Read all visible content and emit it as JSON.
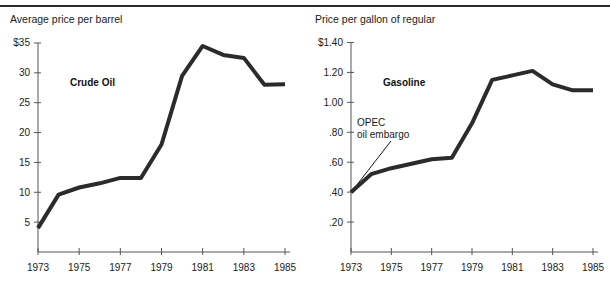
{
  "figure": {
    "divider_present": true,
    "panel_count": 2,
    "line_color": "#2b2b2b",
    "axis_color": "#555555",
    "background": "#ffffff"
  },
  "chart_data": [
    {
      "type": "line",
      "title": "Average price per barrel",
      "series_label": "Crude Oil",
      "xlabel": "",
      "ylabel": "",
      "grid": false,
      "legend": "none",
      "xlim": [
        1973,
        1985
      ],
      "ylim": [
        0,
        36
      ],
      "xticks": [
        1973,
        1975,
        1977,
        1979,
        1981,
        1983,
        1985
      ],
      "xtick_labels": [
        "1973",
        "1975",
        "1977",
        "1979",
        "1981",
        "1983",
        "1985"
      ],
      "yticks": [
        5,
        10,
        15,
        20,
        25,
        30,
        35
      ],
      "ytick_labels": [
        "5",
        "10",
        "15",
        "20",
        "25",
        "30",
        "$35"
      ],
      "x": [
        1973,
        1974,
        1975,
        1976,
        1977,
        1978,
        1979,
        1980,
        1981,
        1982,
        1983,
        1984,
        1985
      ],
      "values": [
        4.0,
        9.6,
        10.8,
        11.5,
        12.4,
        12.4,
        18.0,
        29.5,
        34.5,
        33.0,
        32.5,
        28.0,
        28.1
      ],
      "annotations": []
    },
    {
      "type": "line",
      "title": "Price per gallon of regular",
      "series_label": "Gasoline",
      "xlabel": "",
      "ylabel": "",
      "grid": false,
      "legend": "none",
      "xlim": [
        1973,
        1985
      ],
      "ylim": [
        0,
        1.45
      ],
      "xticks": [
        1973,
        1975,
        1977,
        1979,
        1981,
        1983,
        1985
      ],
      "xtick_labels": [
        "1973",
        "1975",
        "1977",
        "1979",
        "1981",
        "1983",
        "1985"
      ],
      "yticks": [
        0.2,
        0.4,
        0.6,
        0.8,
        1.0,
        1.2,
        1.4
      ],
      "ytick_labels": [
        ".20",
        ".40",
        ".60",
        ".80",
        "1.00",
        "1.20",
        "$1.40"
      ],
      "x": [
        1973,
        1974,
        1975,
        1976,
        1977,
        1978,
        1979,
        1980,
        1981,
        1982,
        1983,
        1984,
        1985
      ],
      "values": [
        0.4,
        0.52,
        0.56,
        0.59,
        0.62,
        0.63,
        0.86,
        1.15,
        1.18,
        1.21,
        1.12,
        1.08,
        1.08
      ],
      "annotations": [
        {
          "text_line1": "OPEC",
          "text_line2": "oil embargo",
          "points_to_x": 1973,
          "points_to_y": 0.4
        }
      ]
    }
  ]
}
